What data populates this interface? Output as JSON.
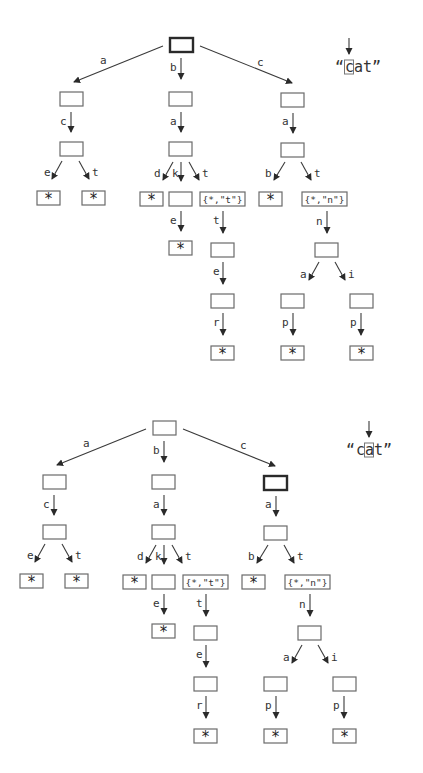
{
  "diagrams": [
    {
      "name": "trie-step-1",
      "offset": [
        0,
        0
      ],
      "active_node": "root",
      "pointer": {
        "word_open_quote": "“",
        "chars": [
          "c",
          "a",
          "t"
        ],
        "word_close_quote": "”",
        "highlight_index": 0
      }
    },
    {
      "name": "trie-step-2",
      "offset": [
        -17,
        383
      ],
      "active_node": "c",
      "pointer": {
        "word_open_quote": "“",
        "chars": [
          "c",
          "a",
          "t"
        ],
        "word_close_quote": "”",
        "highlight_index": 1
      }
    }
  ],
  "trie": {
    "nodes": [
      {
        "id": "root",
        "x": 170,
        "y": 38,
        "text": ""
      },
      {
        "id": "a",
        "x": 60,
        "y": 92,
        "text": ""
      },
      {
        "id": "b",
        "x": 169,
        "y": 92,
        "text": ""
      },
      {
        "id": "c",
        "x": 281,
        "y": 93,
        "text": ""
      },
      {
        "id": "ac",
        "x": 60,
        "y": 142,
        "text": ""
      },
      {
        "id": "ba",
        "x": 169,
        "y": 142,
        "text": ""
      },
      {
        "id": "ca",
        "x": 281,
        "y": 143,
        "text": ""
      },
      {
        "id": "ace",
        "x": 37,
        "y": 191,
        "text": "*",
        "kind": "star"
      },
      {
        "id": "act",
        "x": 82,
        "y": 191,
        "text": "*",
        "kind": "star"
      },
      {
        "id": "bad",
        "x": 140,
        "y": 192,
        "text": "*",
        "kind": "star"
      },
      {
        "id": "bak",
        "x": 169,
        "y": 192,
        "text": ""
      },
      {
        "id": "bat",
        "x": 200,
        "y": 192,
        "text": "{*,\"t\"}",
        "kind": "wide"
      },
      {
        "id": "cab",
        "x": 259,
        "y": 192,
        "text": "*",
        "kind": "star"
      },
      {
        "id": "cat",
        "x": 302,
        "y": 192,
        "text": "{*,\"n\"}",
        "kind": "wide"
      },
      {
        "id": "bake",
        "x": 169,
        "y": 241,
        "text": "*",
        "kind": "star"
      },
      {
        "id": "batt",
        "x": 211,
        "y": 243,
        "text": ""
      },
      {
        "id": "catn",
        "x": 315,
        "y": 243,
        "text": ""
      },
      {
        "id": "batte",
        "x": 211,
        "y": 294,
        "text": ""
      },
      {
        "id": "catna",
        "x": 281,
        "y": 294,
        "text": ""
      },
      {
        "id": "catni",
        "x": 350,
        "y": 294,
        "text": ""
      },
      {
        "id": "batter",
        "x": 211,
        "y": 346,
        "text": "*",
        "kind": "star"
      },
      {
        "id": "catnap",
        "x": 281,
        "y": 346,
        "text": "*",
        "kind": "star"
      },
      {
        "id": "catnip",
        "x": 350,
        "y": 346,
        "text": "*",
        "kind": "star"
      }
    ],
    "edges": [
      {
        "from": "root",
        "to": "a",
        "label": "a",
        "x1": 163,
        "y1": 46,
        "x2": 74,
        "y2": 82,
        "lx": 100,
        "ly": 64
      },
      {
        "from": "root",
        "to": "b",
        "label": "b",
        "x1": 181,
        "y1": 58,
        "x2": 181,
        "y2": 79,
        "lx": 170,
        "ly": 71
      },
      {
        "from": "root",
        "to": "c",
        "label": "c",
        "x1": 200,
        "y1": 46,
        "x2": 292,
        "y2": 83,
        "lx": 257,
        "ly": 66
      },
      {
        "from": "a",
        "to": "ac",
        "label": "c",
        "x1": 71,
        "y1": 112,
        "x2": 71,
        "y2": 132,
        "lx": 60,
        "ly": 125
      },
      {
        "from": "b",
        "to": "ba",
        "label": "a",
        "x1": 181,
        "y1": 112,
        "x2": 181,
        "y2": 132,
        "lx": 170,
        "ly": 125
      },
      {
        "from": "c",
        "to": "ca",
        "label": "a",
        "x1": 293,
        "y1": 113,
        "x2": 293,
        "y2": 133,
        "lx": 282,
        "ly": 125
      },
      {
        "from": "ac",
        "to": "ace",
        "label": "e",
        "x1": 62,
        "y1": 161,
        "x2": 52,
        "y2": 179,
        "lx": 44,
        "ly": 176
      },
      {
        "from": "ac",
        "to": "act",
        "label": "t",
        "x1": 79,
        "y1": 161,
        "x2": 89,
        "y2": 179,
        "lx": 92,
        "ly": 176
      },
      {
        "from": "ba",
        "to": "bad",
        "label": "d",
        "x1": 173,
        "y1": 162,
        "x2": 163,
        "y2": 180,
        "lx": 154,
        "ly": 177
      },
      {
        "from": "ba",
        "to": "bak",
        "label": "k",
        "x1": 181,
        "y1": 162,
        "x2": 181,
        "y2": 181,
        "lx": 172,
        "ly": 177
      },
      {
        "from": "ba",
        "to": "bat",
        "label": "t",
        "x1": 189,
        "y1": 162,
        "x2": 199,
        "y2": 180,
        "lx": 202,
        "ly": 177
      },
      {
        "from": "ca",
        "to": "cab",
        "label": "b",
        "x1": 285,
        "y1": 162,
        "x2": 274,
        "y2": 180,
        "lx": 265,
        "ly": 177
      },
      {
        "from": "ca",
        "to": "cat",
        "label": "t",
        "x1": 301,
        "y1": 162,
        "x2": 311,
        "y2": 180,
        "lx": 314,
        "ly": 177
      },
      {
        "from": "bak",
        "to": "bake",
        "label": "e",
        "x1": 181,
        "y1": 211,
        "x2": 181,
        "y2": 231,
        "lx": 170,
        "ly": 224
      },
      {
        "from": "bat",
        "to": "batt",
        "label": "t",
        "x1": 223,
        "y1": 211,
        "x2": 223,
        "y2": 233,
        "lx": 213,
        "ly": 224
      },
      {
        "from": "cat",
        "to": "catn",
        "label": "n",
        "x1": 327,
        "y1": 211,
        "x2": 327,
        "y2": 233,
        "lx": 316,
        "ly": 225
      },
      {
        "from": "batt",
        "to": "batte",
        "label": "e",
        "x1": 223,
        "y1": 262,
        "x2": 223,
        "y2": 284,
        "lx": 213,
        "ly": 275
      },
      {
        "from": "catn",
        "to": "catna",
        "label": "a",
        "x1": 319,
        "y1": 262,
        "x2": 309,
        "y2": 280,
        "lx": 300,
        "ly": 278
      },
      {
        "from": "catn",
        "to": "catni",
        "label": "i",
        "x1": 335,
        "y1": 262,
        "x2": 345,
        "y2": 280,
        "lx": 348,
        "ly": 278
      },
      {
        "from": "batte",
        "to": "batter",
        "label": "r",
        "x1": 223,
        "y1": 313,
        "x2": 223,
        "y2": 335,
        "lx": 213,
        "ly": 326
      },
      {
        "from": "catna",
        "to": "catnap",
        "label": "p",
        "x1": 293,
        "y1": 313,
        "x2": 293,
        "y2": 335,
        "lx": 282,
        "ly": 326
      },
      {
        "from": "catni",
        "to": "catnip",
        "label": "p",
        "x1": 361,
        "y1": 313,
        "x2": 361,
        "y2": 335,
        "lx": 350,
        "ly": 326
      }
    ]
  }
}
